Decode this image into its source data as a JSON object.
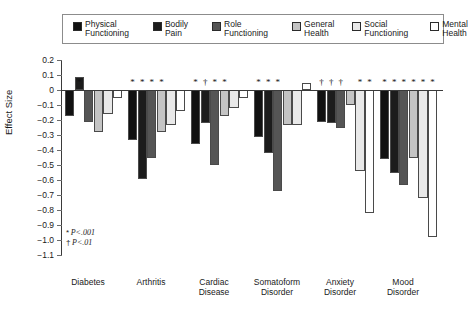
{
  "legend": {
    "items": [
      {
        "label": "Physical\nFunctioning",
        "color": "#111111",
        "name": "physical-functioning"
      },
      {
        "label": "Bodily\nPain",
        "color": "#1c1c1c",
        "name": "bodily-pain"
      },
      {
        "label": "Role\nFunctioning",
        "color": "#555555",
        "name": "role-functioning"
      },
      {
        "label": "General\nHealth",
        "color": "#c4c4c4",
        "name": "general-health"
      },
      {
        "label": "Social\nFunctioning",
        "color": "#e9e9e9",
        "name": "social-functioning"
      },
      {
        "label": "Mental\nHealth",
        "color": "#ffffff",
        "name": "mental-health"
      }
    ]
  },
  "notes": {
    "line1_marker": "*",
    "line1_text": "P<.001",
    "line2_marker": "†",
    "line2_text": "P<.01"
  },
  "chart_data": {
    "type": "bar",
    "title": "",
    "xlabel": "",
    "ylabel": "Effect Size",
    "ylim": [
      -1.1,
      0.2
    ],
    "ytick_step": 0.1,
    "yticks": [
      "0.2",
      "0.1",
      "0",
      "−0.1",
      "−0.2",
      "−0.3",
      "−0.4",
      "−0.5",
      "−0.6",
      "−0.7",
      "−0.8",
      "−0.9",
      "−1.0",
      "−1.1"
    ],
    "ytick_values": [
      0.2,
      0.1,
      0,
      -0.1,
      -0.2,
      -0.3,
      -0.4,
      -0.5,
      -0.6,
      -0.7,
      -0.8,
      -0.9,
      -1.0,
      -1.1
    ],
    "grid": false,
    "legend_position": "top",
    "categories": [
      "Diabetes",
      "Arthritis",
      "Cardiac\nDisease",
      "Somatoform\nDisorder",
      "Anxiety\nDisorder",
      "Mood\nDisorder"
    ],
    "series": [
      {
        "name": "Physical Functioning",
        "color": "#111111",
        "values": [
          -0.17,
          -0.33,
          -0.36,
          -0.31,
          -0.21,
          -0.46
        ]
      },
      {
        "name": "Bodily Pain",
        "color": "#1c1c1c",
        "values": [
          0.09,
          -0.59,
          -0.22,
          -0.42,
          -0.22,
          -0.55
        ]
      },
      {
        "name": "Role Functioning",
        "color": "#555555",
        "values": [
          -0.21,
          -0.45,
          -0.5,
          -0.67,
          -0.25,
          -0.63
        ]
      },
      {
        "name": "General Health",
        "color": "#c4c4c4",
        "values": [
          -0.28,
          -0.28,
          -0.17,
          -0.23,
          -0.1,
          -0.45
        ]
      },
      {
        "name": "Social Functioning",
        "color": "#e9e9e9",
        "values": [
          -0.16,
          -0.23,
          -0.12,
          -0.23,
          -0.54,
          -0.72
        ]
      },
      {
        "name": "Mental Health",
        "color": "#ffffff",
        "values": [
          -0.05,
          -0.14,
          -0.05,
          0.05,
          -0.82,
          -0.98
        ]
      }
    ],
    "significance": [
      [
        "",
        "*",
        "",
        "",
        "",
        ""
      ],
      [
        "*",
        "*",
        "*",
        "*",
        "",
        ""
      ],
      [
        "*",
        "†",
        "*",
        "*",
        "",
        ""
      ],
      [
        "*",
        "*",
        "*",
        "",
        "",
        ""
      ],
      [
        "†",
        "†",
        "†",
        "",
        "*",
        "*"
      ],
      [
        "*",
        "*",
        "*",
        "*",
        "*",
        "*"
      ]
    ]
  }
}
